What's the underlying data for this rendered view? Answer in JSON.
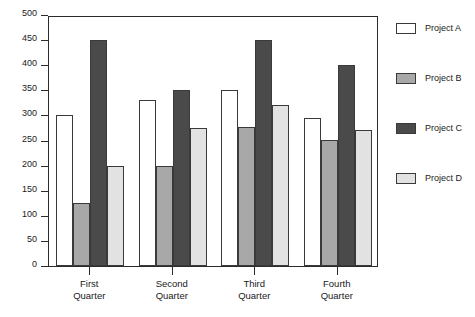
{
  "chart_data": {
    "type": "bar",
    "title": "",
    "subtitle": "",
    "xlabel": "",
    "ylabel": "",
    "ylim": [
      0,
      500
    ],
    "yticks": [
      0,
      50,
      100,
      150,
      200,
      250,
      300,
      350,
      400,
      450,
      500
    ],
    "ytick_labels": [
      "0",
      "50",
      "100",
      "150",
      "200",
      "250",
      "300",
      "350",
      "400",
      "450",
      "500"
    ],
    "grid": false,
    "legend_position": "right",
    "categories": [
      "First Quarter",
      "Second Quarter",
      "Third Quarter",
      "Fourth Quarter"
    ],
    "category_lines": [
      [
        "First",
        "Quarter"
      ],
      [
        "Second",
        "Quarter"
      ],
      [
        "Third",
        "Quarter"
      ],
      [
        "Fourth",
        "Quarter"
      ]
    ],
    "series": [
      {
        "name": "Project A",
        "color": "#ffffff",
        "values": [
          300,
          330,
          350,
          295
        ]
      },
      {
        "name": "Project B",
        "color": "#a8a8a8",
        "values": [
          125,
          200,
          277,
          252
        ]
      },
      {
        "name": "Project C",
        "color": "#4a4a4a",
        "values": [
          450,
          350,
          450,
          400
        ]
      },
      {
        "name": "Project D",
        "color": "#e2e2e2",
        "values": [
          200,
          275,
          320,
          270
        ]
      }
    ]
  },
  "legend": {
    "items": [
      {
        "label": "Project A",
        "color": "#ffffff"
      },
      {
        "label": "Project B",
        "color": "#a8a8a8"
      },
      {
        "label": "Project C",
        "color": "#4a4a4a"
      },
      {
        "label": "Project D",
        "color": "#e2e2e2"
      }
    ]
  },
  "style": {
    "axis_color": "#2b2b2b",
    "bar_border_color": "#3a3a3a",
    "background": "#ffffff",
    "text_color": "#1a1a1a"
  }
}
